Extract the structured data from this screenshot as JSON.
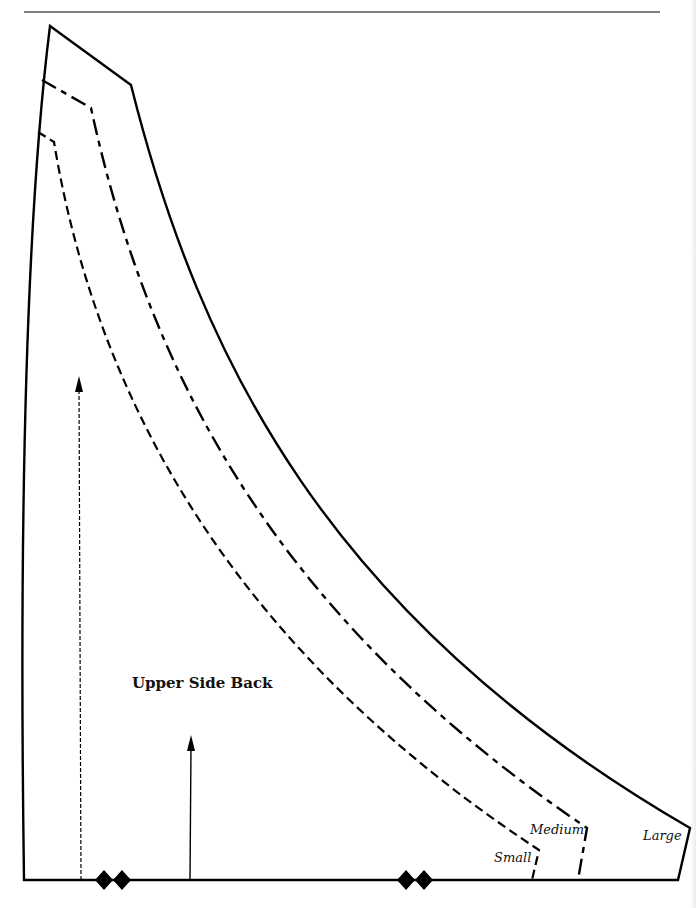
{
  "pattern": {
    "piece_name": "Upper Side Back",
    "sizes": [
      {
        "id": "small",
        "label": "Small",
        "line_style": "short-dash"
      },
      {
        "id": "medium",
        "label": "Medium",
        "line_style": "long-short-dash"
      },
      {
        "id": "large",
        "label": "Large",
        "line_style": "solid"
      }
    ],
    "markings": {
      "grainline_arrows": [
        "dotted-grainline",
        "solid-grainline"
      ],
      "notches": [
        "double-notch-left",
        "double-notch-right"
      ]
    },
    "colors": {
      "ink": "#000000",
      "paper": "#ffffff"
    }
  }
}
